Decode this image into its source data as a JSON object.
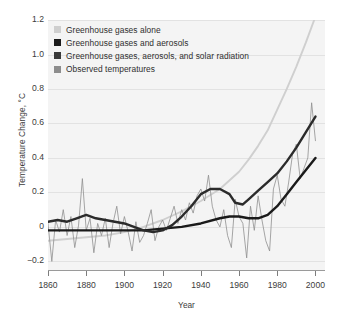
{
  "chart_data": {
    "type": "line",
    "title": "",
    "xlabel": "Year",
    "ylabel": "Temperature Change, °C",
    "xlim": [
      1860,
      2005
    ],
    "ylim": [
      -0.25,
      1.2
    ],
    "grid": true,
    "xticks": [
      1860,
      1880,
      1900,
      1920,
      1940,
      1960,
      1980,
      2000
    ],
    "xtick_labels": [
      "1860",
      "1880",
      "1900",
      "1920",
      "1940",
      "1960",
      "1980",
      "2000"
    ],
    "yticks": [
      -0.2,
      0,
      0.2,
      0.4,
      0.6,
      0.8,
      1.0,
      1.2
    ],
    "ytick_labels": [
      "−0.2",
      "0",
      "0.2",
      "0.4",
      "0.6",
      "0.8",
      "1.0",
      "1.2"
    ],
    "legend_position": "top-left",
    "series": [
      {
        "name": "Greenhouse gases alone",
        "color": "#cfcfcf",
        "width": 1.9,
        "x": [
          1860,
          1870,
          1880,
          1890,
          1900,
          1910,
          1920,
          1930,
          1940,
          1950,
          1960,
          1965,
          1970,
          1975,
          1980,
          1985,
          1990,
          1995,
          2000
        ],
        "y": [
          -0.08,
          -0.07,
          -0.06,
          -0.05,
          -0.03,
          0.0,
          0.04,
          0.09,
          0.15,
          0.22,
          0.32,
          0.39,
          0.47,
          0.56,
          0.68,
          0.8,
          0.93,
          1.07,
          1.22
        ]
      },
      {
        "name": "Greenhouse gases and aerosols",
        "color": "#1a1a1a",
        "width": 2.4,
        "x": [
          1860,
          1870,
          1880,
          1890,
          1900,
          1910,
          1920,
          1930,
          1940,
          1950,
          1955,
          1960,
          1965,
          1970,
          1975,
          1980,
          1985,
          1990,
          1995,
          2000
        ],
        "y": [
          -0.02,
          -0.02,
          -0.02,
          -0.02,
          -0.02,
          -0.02,
          -0.01,
          0.0,
          0.02,
          0.05,
          0.06,
          0.06,
          0.05,
          0.05,
          0.07,
          0.12,
          0.19,
          0.26,
          0.33,
          0.4
        ]
      },
      {
        "name": "Greenhouse gases, aerosols, and solar radiation",
        "color": "#2b2b2b",
        "width": 2.4,
        "x": [
          1860,
          1865,
          1870,
          1875,
          1880,
          1885,
          1890,
          1895,
          1900,
          1905,
          1910,
          1915,
          1920,
          1925,
          1930,
          1935,
          1940,
          1945,
          1950,
          1955,
          1958,
          1962,
          1965,
          1970,
          1975,
          1980,
          1985,
          1990,
          1995,
          2000
        ],
        "y": [
          0.03,
          0.04,
          0.03,
          0.05,
          0.07,
          0.05,
          0.04,
          0.03,
          0.02,
          0.0,
          -0.02,
          -0.03,
          -0.02,
          0.01,
          0.06,
          0.12,
          0.19,
          0.22,
          0.22,
          0.19,
          0.14,
          0.13,
          0.16,
          0.21,
          0.26,
          0.31,
          0.38,
          0.46,
          0.55,
          0.64
        ]
      },
      {
        "name": "Observed temperatures",
        "color": "#8f8f8f",
        "width": 0.8,
        "x": [
          1860,
          1862,
          1864,
          1866,
          1868,
          1870,
          1872,
          1874,
          1876,
          1878,
          1880,
          1882,
          1884,
          1886,
          1888,
          1890,
          1892,
          1894,
          1896,
          1898,
          1900,
          1902,
          1904,
          1906,
          1908,
          1910,
          1912,
          1914,
          1916,
          1918,
          1920,
          1922,
          1924,
          1926,
          1928,
          1930,
          1932,
          1934,
          1936,
          1938,
          1940,
          1942,
          1944,
          1946,
          1948,
          1950,
          1952,
          1954,
          1956,
          1958,
          1960,
          1962,
          1964,
          1966,
          1968,
          1970,
          1972,
          1974,
          1976,
          1978,
          1980,
          1982,
          1984,
          1986,
          1988,
          1990,
          1992,
          1994,
          1996,
          1998,
          2000
        ],
        "y": [
          0.02,
          -0.2,
          0.04,
          -0.03,
          0.1,
          -0.05,
          0.06,
          -0.12,
          0.01,
          0.28,
          -0.02,
          0.05,
          -0.15,
          0.02,
          -0.05,
          0.05,
          -0.12,
          0.02,
          0.12,
          -0.04,
          0.06,
          -0.03,
          -0.14,
          0.03,
          -0.09,
          -0.05,
          0.02,
          0.1,
          -0.08,
          0.0,
          0.04,
          -0.02,
          0.05,
          0.12,
          0.02,
          0.1,
          0.04,
          0.14,
          0.08,
          0.18,
          0.22,
          0.15,
          0.3,
          0.12,
          0.04,
          0.0,
          0.1,
          -0.05,
          -0.12,
          0.16,
          0.06,
          0.02,
          -0.18,
          0.12,
          -0.02,
          0.18,
          0.04,
          -0.08,
          -0.14,
          0.22,
          0.3,
          0.16,
          0.12,
          0.26,
          0.42,
          0.48,
          0.28,
          0.34,
          0.4,
          0.72,
          0.5
        ]
      }
    ],
    "legend": [
      {
        "label": "Greenhouse gases alone",
        "color": "#cfcfcf"
      },
      {
        "label": "Greenhouse gases and aerosols",
        "color": "#1a1a1a"
      },
      {
        "label": "Greenhouse gases, aerosols, and solar radiation",
        "color": "#3a3a3a"
      },
      {
        "label": "Observed temperatures",
        "color": "#8d8d8d"
      }
    ]
  }
}
